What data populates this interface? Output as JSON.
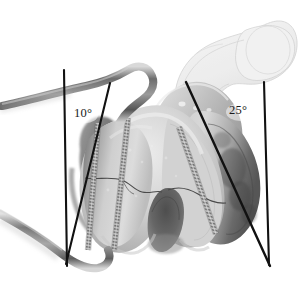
{
  "figure": {
    "background_color": "#ffffff",
    "line_color": "#111111",
    "bone_fill_light": "#e8e8e8",
    "bone_fill_mid": "#b4b4b4",
    "bone_fill_dark": "#6e6e6e",
    "outline_overlay_color": "#cccccc",
    "instrument_color": "#8a8a8a"
  },
  "annotations": {
    "medial_angle": {
      "value": "10°",
      "side": "left",
      "degrees": 10
    },
    "lateral_angle": {
      "value": "25°",
      "side": "right",
      "degrees": 25
    }
  },
  "reference_lines": [
    {
      "name": "left-vertical-reference-line",
      "x1": 64,
      "y1": 70,
      "x2": 67,
      "y2": 266
    },
    {
      "name": "left-angled-axis-line",
      "x1": 110,
      "y1": 83,
      "x2": 66,
      "y2": 264
    },
    {
      "name": "right-angled-axis-line",
      "x1": 186,
      "y1": 82,
      "x2": 270,
      "y2": 266
    },
    {
      "name": "right-vertical-reference-line",
      "x1": 264,
      "y1": 82,
      "x2": 269,
      "y2": 265
    }
  ],
  "implants": {
    "type": "cannulated threaded screws",
    "count": 3,
    "screws": [
      {
        "name": "medial-screw",
        "x1": 98,
        "y1": 124,
        "x2": 88,
        "y2": 248
      },
      {
        "name": "central-screw",
        "x1": 127,
        "y1": 119,
        "x2": 113,
        "y2": 249
      },
      {
        "name": "lateral-screw",
        "x1": 180,
        "y1": 128,
        "x2": 215,
        "y2": 233
      }
    ]
  },
  "anatomy": {
    "primary_structure": "distal femur condyles",
    "features": [
      "medial condyle",
      "lateral condyle",
      "intercondylar notch",
      "trochlear groove",
      "fracture line medial condyle",
      "fracture line lateral condyle"
    ],
    "overlay_structure": "proximal femur outline (head, neck, greater trochanter)"
  },
  "instruments": [
    {
      "name": "upper-curved-guide-instrument",
      "description": "curved radiolucent guide entering from left margin"
    },
    {
      "name": "lower-curved-retractor-instrument",
      "description": "curved retractor hooking beneath condyle"
    }
  ]
}
